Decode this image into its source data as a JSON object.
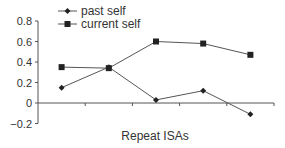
{
  "chart_data": {
    "type": "line",
    "title": "",
    "xlabel": "Repeat ISAs",
    "ylabel": "",
    "categories": [
      "1",
      "2",
      "3",
      "4",
      "5"
    ],
    "show_category_labels": false,
    "series": [
      {
        "name": "past self",
        "marker": "diamond",
        "values": [
          0.15,
          0.35,
          0.03,
          0.12,
          -0.11
        ]
      },
      {
        "name": "current self",
        "marker": "square",
        "values": [
          0.35,
          0.34,
          0.6,
          0.58,
          0.47
        ]
      }
    ],
    "ylim": [
      -0.2,
      0.8
    ],
    "yticks": [
      0.8,
      0.6,
      0.4,
      0.2,
      0,
      -0.2
    ],
    "ytick_labels": [
      "0.8",
      "0.6",
      "0.4",
      "0.2",
      "0",
      "−0.2"
    ],
    "grid": false,
    "legend_position": "top-left",
    "line_color": "#555555",
    "marker_color": "#222222"
  }
}
